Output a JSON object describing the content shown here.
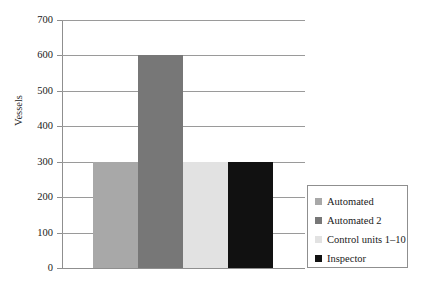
{
  "chart_data": {
    "type": "bar",
    "title": "",
    "subtitle": "",
    "xlabel": "",
    "ylabel": "Vessels",
    "categories": [
      "Automated",
      "Automated 2",
      "Control units 1–10",
      "Inspector"
    ],
    "values": [
      300,
      600,
      300,
      300
    ],
    "series": [
      {
        "name": "Vessels",
        "values": [
          300,
          600,
          300,
          300
        ]
      }
    ],
    "ylim": [
      0,
      700
    ],
    "ytick_step": 100,
    "yticks": [
      "700",
      "600",
      "500",
      "400",
      "300",
      "200",
      "100",
      "0"
    ],
    "ytick_values": [
      700,
      600,
      500,
      400,
      300,
      200,
      100,
      0
    ],
    "xticks": [],
    "grid": "horizontal",
    "legend_position": "right",
    "bar_gap": 0,
    "colors": {
      "bar_automated": "#a8a8a8",
      "bar_automated_2": "#777777",
      "bar_control_units": "#e2e2e2",
      "bar_inspector": "#111111",
      "grid": "#9a9a9a",
      "axis": "#8f8f8f",
      "text": "#1a1a1a",
      "background": "#ffffff",
      "legend_border": "#8f8f8f"
    }
  },
  "axis": {
    "y_title": "Vessels",
    "ticks": [
      {
        "label": "700",
        "value": 700
      },
      {
        "label": "600",
        "value": 600
      },
      {
        "label": "500",
        "value": 500
      },
      {
        "label": "400",
        "value": 400
      },
      {
        "label": "300",
        "value": 300
      },
      {
        "label": "200",
        "value": 200
      },
      {
        "label": "100",
        "value": 100
      },
      {
        "label": "0",
        "value": 0
      }
    ]
  },
  "bars": [
    {
      "label": "Automated",
      "value": 300,
      "color": "#a8a8a8"
    },
    {
      "label": "Automated 2",
      "value": 600,
      "color": "#777777"
    },
    {
      "label": "Control units 1–10",
      "value": 300,
      "color": "#e2e2e2"
    },
    {
      "label": "Inspector",
      "value": 300,
      "color": "#111111"
    }
  ],
  "legend": {
    "items": [
      {
        "label": "Automated",
        "color": "#a8a8a8"
      },
      {
        "label": "Automated 2",
        "color": "#777777"
      },
      {
        "label": "Control units 1–10",
        "color": "#e2e2e2"
      },
      {
        "label": "Inspector",
        "color": "#111111"
      }
    ]
  }
}
